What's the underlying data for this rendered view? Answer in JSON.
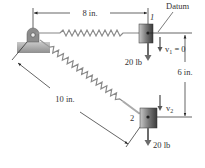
{
  "diagram": {
    "labels": {
      "top_dimension": "8 in.",
      "diagonal_dimension": "10 in.",
      "vertical_dimension": "6 in.",
      "datum": "Datum",
      "position_1": "1",
      "position_2": "2",
      "weight_1": "20 lb",
      "weight_2": "20 lb",
      "velocity_1": "v",
      "velocity_1_sub": "1",
      "velocity_1_value": " = 0",
      "velocity_2": "v",
      "velocity_2_sub": "2"
    },
    "colors": {
      "line": "#222222",
      "spring": "#8a8a8a",
      "block_dark": "#3a3a3a",
      "block_light": "#b5b5b5",
      "arrow": "#6b6b6b",
      "support": "#9a9a9a"
    }
  }
}
